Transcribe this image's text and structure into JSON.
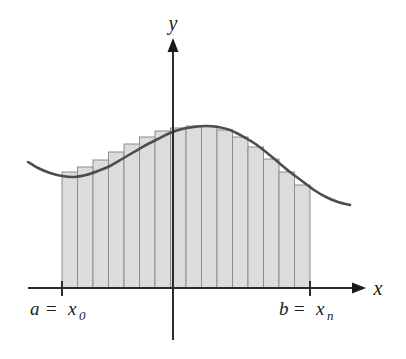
{
  "figure": {
    "background": "#ffffff"
  },
  "axes": {
    "x_axis": {
      "label": "x",
      "name": "x-axis",
      "y_pixel": 288,
      "start_x": 28,
      "end_x": 352,
      "arrow": "right-arrowhead",
      "color": "#2b2b2b"
    },
    "y_axis": {
      "label": "y",
      "name": "y-axis",
      "x_pixel": 173,
      "top_y": 40,
      "bottom_y": 340,
      "arrow": "up-arrowhead",
      "color": "#2b2b2b"
    }
  },
  "labels": {
    "left_bound": {
      "var": "a",
      "equals": "=",
      "endpoint": "x",
      "subscript": "0"
    },
    "right_bound": {
      "var": "b",
      "equals": "=",
      "endpoint": "x",
      "subscript": "n"
    },
    "x_axis_label": "x",
    "y_axis_label": "y"
  },
  "colors": {
    "curve": "#4d4d4d",
    "rectangle_fill": "#dcdcdc",
    "rectangle_stroke": "#8c8c8c",
    "axis": "#2b2b2b",
    "text": "#1a1a1a",
    "background": "#ffffff"
  },
  "chart_data": {
    "type": "area",
    "xlabel": "x",
    "ylabel": "y",
    "grid": false,
    "legend": false,
    "interval": {
      "a": "x_0",
      "b": "x_n",
      "a_pixel": 62,
      "b_pixel": 310
    },
    "n_rectangles": 16,
    "rule": "right-endpoint",
    "baseline_pixel_y": 288,
    "partition_pixels_x": [
      62,
      77.5,
      93,
      108.5,
      124,
      139.5,
      155,
      170.5,
      186,
      201.5,
      217,
      232.5,
      248,
      263.5,
      279,
      294.5,
      310
    ],
    "rectangle_top_pixels_y": [
      172,
      167,
      160,
      152,
      144,
      137,
      131,
      128,
      126,
      126,
      130,
      137,
      147,
      159,
      172,
      185
    ],
    "curve_pixel_points": [
      [
        28,
        162
      ],
      [
        38,
        168
      ],
      [
        50,
        173
      ],
      [
        62,
        176
      ],
      [
        74,
        177
      ],
      [
        86,
        175
      ],
      [
        98,
        171
      ],
      [
        110,
        166
      ],
      [
        122,
        159
      ],
      [
        134,
        152
      ],
      [
        146,
        145
      ],
      [
        158,
        139
      ],
      [
        170,
        133
      ],
      [
        182,
        129
      ],
      [
        194,
        127
      ],
      [
        206,
        126
      ],
      [
        218,
        127
      ],
      [
        230,
        130
      ],
      [
        242,
        136
      ],
      [
        254,
        143
      ],
      [
        266,
        152
      ],
      [
        278,
        162
      ],
      [
        290,
        172
      ],
      [
        302,
        181
      ],
      [
        314,
        190
      ],
      [
        326,
        197
      ],
      [
        338,
        202
      ],
      [
        350,
        205
      ]
    ],
    "curve_extends_beyond_interval": true,
    "peak": {
      "x_pixel": 206,
      "y_pixel": 126
    },
    "local_min": {
      "x_pixel": 74,
      "y_pixel": 177
    }
  }
}
